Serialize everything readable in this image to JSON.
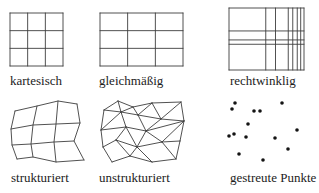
{
  "figure": {
    "background": "#ffffff",
    "line_color": "#3d3d3d",
    "dot_color": "#141414",
    "label_color": "#1c1c1c",
    "panels": [
      {
        "id": "kartesisch",
        "label": "kartesisch",
        "type": "grid",
        "box": [
          10,
          13,
          53,
          53
        ],
        "v_lines": [
          0,
          0.333,
          0.667,
          1
        ],
        "h_lines": [
          0,
          0.333,
          0.667,
          1
        ]
      },
      {
        "id": "gleichmaessig",
        "label": "gleichmäßig",
        "type": "grid",
        "box": [
          100,
          13,
          83,
          53
        ],
        "v_lines": [
          0,
          0.333,
          0.667,
          1
        ],
        "h_lines": [
          0,
          0.333,
          0.667,
          1
        ]
      },
      {
        "id": "rechtwinklig",
        "label": "rechtwinklig",
        "type": "grid",
        "box": [
          229,
          8,
          75,
          62
        ],
        "v_lines": [
          0,
          0.49,
          0.62,
          0.79,
          0.85,
          0.91,
          0.956,
          1
        ],
        "h_lines": [
          0,
          0.37,
          0.515,
          0.585,
          1
        ]
      },
      {
        "id": "strukturiert",
        "label": "strukturiert",
        "type": "curvilinear",
        "rows": [
          [
            [
              15,
              111
            ],
            [
              37,
              106
            ],
            [
              58,
              101
            ],
            [
              77,
              104
            ]
          ],
          [
            [
              11,
              129
            ],
            [
              33,
              125
            ],
            [
              56,
              124
            ],
            [
              80,
              123
            ]
          ],
          [
            [
              12,
              145
            ],
            [
              31,
              144
            ],
            [
              54,
              142
            ],
            [
              74,
              141
            ]
          ],
          [
            [
              17,
              159
            ],
            [
              33,
              157
            ],
            [
              56,
              162
            ],
            [
              84,
              160
            ]
          ]
        ]
      },
      {
        "id": "unstrukturiert",
        "label": "unstrukturiert",
        "type": "mesh",
        "nodes": [
          [
            104,
            110
          ],
          [
            118,
            101
          ],
          [
            133,
            107
          ],
          [
            152,
            103
          ],
          [
            181,
            102
          ],
          [
            184,
            121
          ],
          [
            180,
            141
          ],
          [
            176,
            159
          ],
          [
            152,
            162
          ],
          [
            130,
            156
          ],
          [
            112,
            162
          ],
          [
            103,
            147
          ],
          [
            101,
            130
          ],
          [
            121,
            112
          ],
          [
            138,
            115
          ],
          [
            126,
            127
          ],
          [
            146,
            131
          ],
          [
            137,
            147
          ],
          [
            161,
            119
          ],
          [
            162,
            142
          ],
          [
            116,
            140
          ]
        ],
        "edges": [
          [
            0,
            1
          ],
          [
            1,
            2
          ],
          [
            2,
            3
          ],
          [
            3,
            4
          ],
          [
            4,
            5
          ],
          [
            5,
            6
          ],
          [
            6,
            7
          ],
          [
            7,
            8
          ],
          [
            8,
            9
          ],
          [
            9,
            10
          ],
          [
            10,
            11
          ],
          [
            11,
            12
          ],
          [
            12,
            0
          ],
          [
            0,
            13
          ],
          [
            1,
            13
          ],
          [
            2,
            13
          ],
          [
            12,
            13
          ],
          [
            13,
            14
          ],
          [
            13,
            15
          ],
          [
            2,
            14
          ],
          [
            3,
            14
          ],
          [
            14,
            18
          ],
          [
            3,
            18
          ],
          [
            4,
            18
          ],
          [
            5,
            18
          ],
          [
            14,
            16
          ],
          [
            15,
            16
          ],
          [
            16,
            18
          ],
          [
            5,
            16
          ],
          [
            16,
            19
          ],
          [
            16,
            17
          ],
          [
            5,
            19
          ],
          [
            6,
            19
          ],
          [
            17,
            19
          ],
          [
            7,
            19
          ],
          [
            8,
            17
          ],
          [
            9,
            17
          ],
          [
            15,
            17
          ],
          [
            12,
            15
          ],
          [
            15,
            20
          ],
          [
            11,
            20
          ],
          [
            9,
            20
          ],
          [
            17,
            20
          ]
        ]
      },
      {
        "id": "gestreute_punkte",
        "label": "gestreute Punkte",
        "type": "scatter",
        "dot_radius": 1.8,
        "points": [
          [
            235,
            103
          ],
          [
            282,
            103
          ],
          [
            232,
            109
          ],
          [
            254,
            111
          ],
          [
            260,
            111
          ],
          [
            248,
            124
          ],
          [
            297,
            130
          ],
          [
            234,
            134
          ],
          [
            229,
            136
          ],
          [
            246,
            137
          ],
          [
            275,
            138
          ],
          [
            288,
            149
          ],
          [
            239,
            154
          ],
          [
            263,
            160
          ]
        ]
      }
    ]
  }
}
